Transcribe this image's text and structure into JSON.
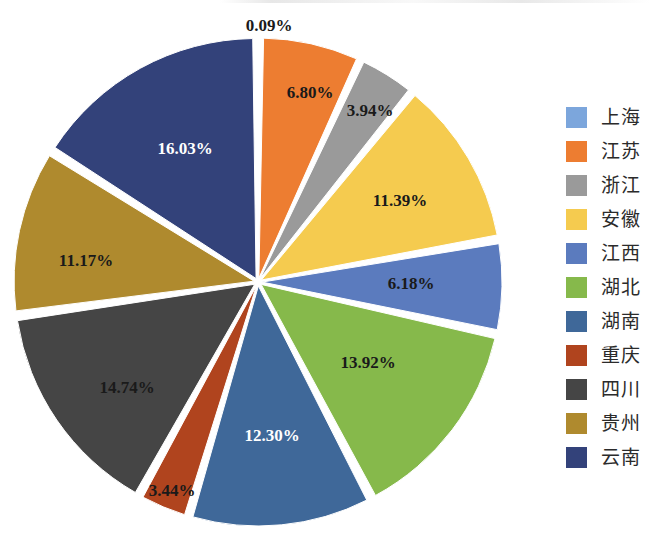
{
  "chart_data": {
    "type": "pie",
    "title": "",
    "subtitle": "",
    "xlabel": "",
    "ylabel": "",
    "legend_position": "right",
    "grid": false,
    "value_unit": "%",
    "exploded": true,
    "categories": [
      "上海",
      "江苏",
      "浙江",
      "安徽",
      "江西",
      "湖北",
      "湖南",
      "重庆",
      "四川",
      "贵州",
      "云南"
    ],
    "values": [
      0.09,
      6.8,
      3.94,
      11.39,
      6.18,
      13.92,
      12.3,
      3.44,
      14.74,
      11.17,
      16.03
    ],
    "data_labels": [
      "0.09%",
      "6.80%",
      "3.94%",
      "11.39%",
      "6.18%",
      "13.92%",
      "12.30%",
      "3.44%",
      "14.74%",
      "11.17%",
      "16.03%"
    ],
    "colors": [
      "#7CA6DC",
      "#ED7D31",
      "#9A9A9A",
      "#F5CB4F",
      "#5B7BBE",
      "#86B94B",
      "#3F6899",
      "#B0441E",
      "#454545",
      "#AF8A2E",
      "#33427A"
    ],
    "label_colors": [
      "#1a1a1a",
      "#1a1a1a",
      "#1a1a1a",
      "#1a1a1a",
      "#1a1a1a",
      "#1a1a1a",
      "#ffffff",
      "#1a1a1a",
      "#1a1a1a",
      "#1a1a1a",
      "#ffffff"
    ],
    "slices": [
      {
        "name": "上海",
        "value": 0.09,
        "label": "0.09%",
        "color": "#7CA6DC",
        "label_color": "#1a1a1a",
        "label_x": 269,
        "label_y": 27,
        "outside": true
      },
      {
        "name": "江苏",
        "value": 6.8,
        "label": "6.80%",
        "color": "#ED7D31",
        "label_color": "#1a1a1a",
        "label_x": 310,
        "label_y": 94,
        "outside": false
      },
      {
        "name": "浙江",
        "value": 3.94,
        "label": "3.94%",
        "color": "#9A9A9A",
        "label_color": "#1a1a1a",
        "label_x": 370,
        "label_y": 112,
        "outside": false
      },
      {
        "name": "安徽",
        "value": 11.39,
        "label": "11.39%",
        "color": "#F5CB4F",
        "label_color": "#1a1a1a",
        "label_x": 400,
        "label_y": 202,
        "outside": false
      },
      {
        "name": "江西",
        "value": 6.18,
        "label": "6.18%",
        "color": "#5B7BBE",
        "label_color": "#1a1a1a",
        "label_x": 411,
        "label_y": 285,
        "outside": false
      },
      {
        "name": "湖北",
        "value": 13.92,
        "label": "13.92%",
        "color": "#86B94B",
        "label_color": "#1a1a1a",
        "label_x": 368,
        "label_y": 364,
        "outside": false
      },
      {
        "name": "湖南",
        "value": 12.3,
        "label": "12.30%",
        "color": "#3F6899",
        "label_color": "#ffffff",
        "label_x": 272,
        "label_y": 437,
        "outside": false
      },
      {
        "name": "重庆",
        "value": 3.44,
        "label": "3.44%",
        "color": "#B0441E",
        "label_color": "#1a1a1a",
        "label_x": 172,
        "label_y": 492,
        "outside": false
      },
      {
        "name": "四川",
        "value": 14.74,
        "label": "14.74%",
        "color": "#454545",
        "label_color": "#1a1a1a",
        "label_x": 127,
        "label_y": 389,
        "outside": false
      },
      {
        "name": "贵州",
        "value": 11.17,
        "label": "11.17%",
        "color": "#AF8A2E",
        "label_color": "#1a1a1a",
        "label_x": 86,
        "label_y": 262,
        "outside": false
      },
      {
        "name": "云南",
        "value": 16.03,
        "label": "16.03%",
        "color": "#33427A",
        "label_color": "#ffffff",
        "label_x": 185,
        "label_y": 150,
        "outside": false
      }
    ],
    "geometry": {
      "cx": 258,
      "cy": 282,
      "radius": 240,
      "start_angle_deg": -90,
      "gap_deg": 1.6,
      "explode_px": 4
    }
  },
  "legend": {
    "items": [
      {
        "label": "上海",
        "color": "#7CA6DC"
      },
      {
        "label": "江苏",
        "color": "#ED7D31"
      },
      {
        "label": "浙江",
        "color": "#9A9A9A"
      },
      {
        "label": "安徽",
        "color": "#F5CB4F"
      },
      {
        "label": "江西",
        "color": "#5B7BBE"
      },
      {
        "label": "湖北",
        "color": "#86B94B"
      },
      {
        "label": "湖南",
        "color": "#3F6899"
      },
      {
        "label": "重庆",
        "color": "#B0441E"
      },
      {
        "label": "四川",
        "color": "#454545"
      },
      {
        "label": "贵州",
        "color": "#AF8A2E"
      },
      {
        "label": "云南",
        "color": "#33427A"
      }
    ]
  }
}
